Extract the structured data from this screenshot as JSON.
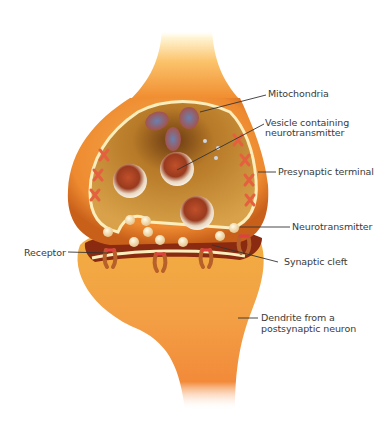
{
  "colors": {
    "neuron_outer": "#f39a3c",
    "neuron_light": "#fff3c8",
    "terminal_inner": "#c98a2a",
    "membrane": "#fbeebc",
    "cleft": "#8a2a10",
    "receptor": "#e35a3a",
    "mitochondria": "#5b6fa0",
    "label_text": "#3a3a3a"
  },
  "labels": {
    "mitochondria": "Mitochondria",
    "vesicle_line1": "Vesicle containing",
    "vesicle_line2": "neurotransmitter",
    "presynaptic_terminal": "Presynaptic terminal",
    "neurotransmitter": "Neurotransmitter",
    "receptor": "Receptor",
    "synaptic_cleft": "Synaptic cleft",
    "dendrite_line1": "Dendrite from a",
    "dendrite_line2": "postsynaptic neuron"
  }
}
